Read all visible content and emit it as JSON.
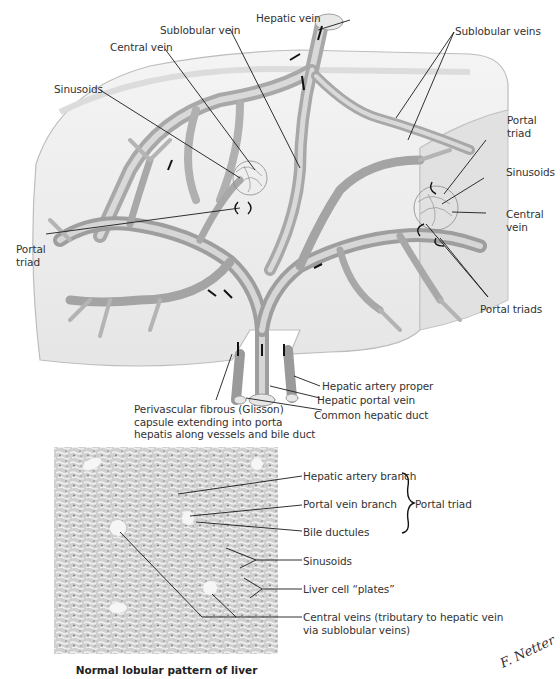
{
  "figure": {
    "title": "Normal lobular pattern of liver",
    "signature": "F. Netter",
    "top_illustration": {
      "labels": {
        "hepatic_vein": "Hepatic vein",
        "sublobular_vein": "Sublobular vein",
        "central_vein_left": "Central vein",
        "sinusoids_left": "Sinusoids",
        "sublobular_veins": "Sublobular veins",
        "portal_triad_right_line1": "Portal",
        "portal_triad_right_line2": "triad",
        "sinusoids_right": "Sinusoids",
        "central_vein_right_line1": "Central",
        "central_vein_right_line2": "vein",
        "portal_triad_left_line1": "Portal",
        "portal_triad_left_line2": "triad",
        "portal_triads": "Portal triads",
        "hepatic_artery_proper": "Hepatic artery proper",
        "hepatic_portal_vein": "Hepatic portal vein",
        "common_hepatic_duct": "Common hepatic duct",
        "glisson_line1": "Perivascular fibrous (Glisson)",
        "glisson_line2": "capsule extending into porta",
        "glisson_line3": "hepatis along vessels and bile duct"
      }
    },
    "micrograph": {
      "labels": {
        "hepatic_artery_branch": "Hepatic artery branch",
        "portal_vein_branch": "Portal vein branch",
        "bile_ductules": "Bile ductules",
        "portal_triad_group": "Portal triad",
        "sinusoids": "Sinusoids",
        "liver_cell_plates": "Liver cell “plates”",
        "central_veins_line1": "Central veins (tributary to hepatic vein",
        "central_veins_line2": "via sublobular veins)"
      }
    }
  },
  "colors": {
    "background": "#ffffff",
    "liver_fill": "#ececec",
    "liver_edge": "#b8b8b8",
    "vessel": "#a9a9a9",
    "vessel_light": "#d4d4d4",
    "leader_line": "#1a1a1a",
    "label_text": "#333333"
  }
}
